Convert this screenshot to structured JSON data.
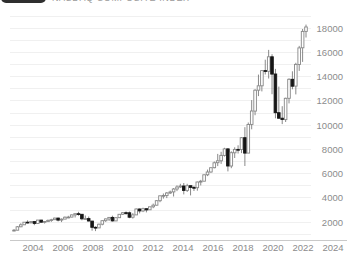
{
  "header": {
    "title": "NASDAQ COMPOSITE INDEX"
  },
  "chart_data": {
    "type": "candlestick",
    "title": "NASDAQ COMPOSITE INDEX",
    "x_tick_labels": [
      "2004",
      "2006",
      "2008",
      "2010",
      "2012",
      "2014",
      "2016",
      "2018",
      "2020",
      "2022",
      "2024"
    ],
    "y_ticks": [
      2000,
      4000,
      6000,
      8000,
      10000,
      12000,
      14000,
      16000,
      18000
    ],
    "grid_step": 1000,
    "grid_min": 1000,
    "grid_max": 19000,
    "ylim": [
      500,
      19500
    ],
    "legend_position": "none",
    "grid": true,
    "candles_format": [
      "period",
      "open",
      "high",
      "low",
      "close"
    ],
    "candles": [
      [
        "2003Q1",
        1336,
        1430,
        1253,
        1341
      ],
      [
        "2003Q2",
        1341,
        1685,
        1336,
        1623
      ],
      [
        "2003Q3",
        1623,
        1913,
        1598,
        1787
      ],
      [
        "2003Q4",
        1787,
        2015,
        1783,
        2003
      ],
      [
        "2004Q1",
        2003,
        2154,
        1896,
        1994
      ],
      [
        "2004Q2",
        1994,
        2090,
        1865,
        2048
      ],
      [
        "2004Q3",
        2048,
        2055,
        1751,
        1897
      ],
      [
        "2004Q4",
        1897,
        2192,
        1897,
        2175
      ],
      [
        "2005Q1",
        2175,
        2191,
        1969,
        1999
      ],
      [
        "2005Q2",
        1999,
        2098,
        1890,
        2057
      ],
      [
        "2005Q3",
        2057,
        2219,
        2025,
        2152
      ],
      [
        "2005Q4",
        2152,
        2278,
        2037,
        2205
      ],
      [
        "2006Q1",
        2205,
        2375,
        2190,
        2340
      ],
      [
        "2006Q2",
        2340,
        2378,
        2065,
        2172
      ],
      [
        "2006Q3",
        2172,
        2306,
        2012,
        2258
      ],
      [
        "2006Q4",
        2258,
        2470,
        2258,
        2415
      ],
      [
        "2007Q1",
        2415,
        2531,
        2331,
        2422
      ],
      [
        "2007Q2",
        2422,
        2634,
        2402,
        2603
      ],
      [
        "2007Q3",
        2603,
        2725,
        2386,
        2702
      ],
      [
        "2007Q4",
        2702,
        2861,
        2540,
        2652
      ],
      [
        "2008Q1",
        2652,
        2661,
        2155,
        2279
      ],
      [
        "2008Q2",
        2279,
        2550,
        2240,
        2293
      ],
      [
        "2008Q3",
        2293,
        2473,
        2070,
        2092
      ],
      [
        "2008Q4",
        2092,
        2110,
        1295,
        1577
      ],
      [
        "2009Q1",
        1577,
        1665,
        1266,
        1529
      ],
      [
        "2009Q2",
        1529,
        1880,
        1520,
        1835
      ],
      [
        "2009Q3",
        1835,
        2168,
        1747,
        2122
      ],
      [
        "2009Q4",
        2122,
        2295,
        2024,
        2269
      ],
      [
        "2010Q1",
        2269,
        2432,
        2100,
        2398
      ],
      [
        "2010Q2",
        2398,
        2535,
        2061,
        2109
      ],
      [
        "2010Q3",
        2109,
        2388,
        2091,
        2369
      ],
      [
        "2010Q4",
        2369,
        2675,
        2344,
        2653
      ],
      [
        "2011Q1",
        2653,
        2840,
        2603,
        2781
      ],
      [
        "2011Q2",
        2781,
        2887,
        2599,
        2774
      ],
      [
        "2011Q3",
        2774,
        2879,
        2332,
        2415
      ],
      [
        "2011Q4",
        2415,
        2753,
        2298,
        2605
      ],
      [
        "2012Q1",
        2605,
        3134,
        2605,
        3092
      ],
      [
        "2012Q2",
        3092,
        3129,
        2726,
        2935
      ],
      [
        "2012Q3",
        2935,
        3196,
        2830,
        3116
      ],
      [
        "2012Q4",
        3116,
        3118,
        2810,
        3020
      ],
      [
        "2013Q1",
        3020,
        3270,
        3020,
        3268
      ],
      [
        "2013Q2",
        3268,
        3532,
        3154,
        3403
      ],
      [
        "2013Q3",
        3403,
        3818,
        3378,
        3771
      ],
      [
        "2013Q4",
        3771,
        4177,
        3650,
        4177
      ],
      [
        "2014Q1",
        4177,
        4371,
        3946,
        4199
      ],
      [
        "2014Q2",
        4199,
        4485,
        3986,
        4408
      ],
      [
        "2014Q3",
        4408,
        4610,
        4324,
        4493
      ],
      [
        "2014Q4",
        4493,
        4815,
        4117,
        4736
      ],
      [
        "2015Q1",
        4736,
        5042,
        4563,
        4901
      ],
      [
        "2015Q2",
        4901,
        5164,
        4825,
        4987
      ],
      [
        "2015Q3",
        4987,
        5232,
        4292,
        4620
      ],
      [
        "2015Q4",
        4620,
        5163,
        4487,
        5007
      ],
      [
        "2016Q1",
        5007,
        5012,
        4210,
        4870
      ],
      [
        "2016Q2",
        4870,
        5000,
        4574,
        4843
      ],
      [
        "2016Q3",
        4843,
        5342,
        4594,
        5312
      ],
      [
        "2016Q4",
        5312,
        5487,
        5034,
        5383
      ],
      [
        "2017Q1",
        5383,
        5928,
        5383,
        5912
      ],
      [
        "2017Q2",
        5912,
        6341,
        5805,
        6140
      ],
      [
        "2017Q3",
        6140,
        6497,
        6081,
        6496
      ],
      [
        "2017Q4",
        6496,
        7004,
        6443,
        6903
      ],
      [
        "2018Q1",
        6903,
        7637,
        6630,
        7063
      ],
      [
        "2018Q2",
        7063,
        7806,
        6805,
        7510
      ],
      [
        "2018Q3",
        7510,
        8133,
        7419,
        8046
      ],
      [
        "2018Q4",
        8046,
        8107,
        6190,
        6635
      ],
      [
        "2019Q1",
        6635,
        7850,
        6457,
        7729
      ],
      [
        "2019Q2",
        7729,
        8176,
        7292,
        8006
      ],
      [
        "2019Q3",
        8006,
        8339,
        7662,
        7999
      ],
      [
        "2019Q4",
        7999,
        9022,
        7700,
        8973
      ],
      [
        "2020Q1",
        8973,
        9838,
        6631,
        7700
      ],
      [
        "2020Q2",
        7700,
        10222,
        7700,
        10059
      ],
      [
        "2020Q3",
        10059,
        12074,
        9663,
        11168
      ],
      [
        "2020Q4",
        11168,
        12973,
        10822,
        12888
      ],
      [
        "2021Q1",
        12888,
        14175,
        12397,
        13247
      ],
      [
        "2021Q2",
        13247,
        14535,
        12786,
        14504
      ],
      [
        "2021Q3",
        14504,
        15403,
        14178,
        14449
      ],
      [
        "2021Q4",
        14449,
        16212,
        13850,
        15645
      ],
      [
        "2022Q1",
        15645,
        15853,
        12555,
        14221
      ],
      [
        "2022Q2",
        14221,
        14647,
        10565,
        11029
      ],
      [
        "2022Q3",
        11029,
        13181,
        10525,
        10576
      ],
      [
        "2022Q4",
        10576,
        11571,
        10089,
        10466
      ],
      [
        "2023Q1",
        10466,
        12270,
        10265,
        12222
      ],
      [
        "2023Q2",
        12222,
        13864,
        11798,
        13788
      ],
      [
        "2023Q3",
        13788,
        14446,
        12963,
        13219
      ],
      [
        "2023Q4",
        13219,
        15150,
        12544,
        15011
      ],
      [
        "2024Q1",
        15011,
        16538,
        14477,
        16379
      ],
      [
        "2024Q2",
        16379,
        17936,
        15222,
        17733
      ],
      [
        "2024Q3",
        17733,
        18300,
        17233,
        18100
      ]
    ],
    "colors": {
      "up_fill": "#ffffff",
      "up_border": "#878787",
      "down": "#161616",
      "wick": "#6b6b6b",
      "grid": "#f0f0f0",
      "axis": "#c9c9c9",
      "tick_text": "#8c8c8c",
      "header_button": "#2f2f2f",
      "header_title": "#9b9b9b"
    }
  }
}
